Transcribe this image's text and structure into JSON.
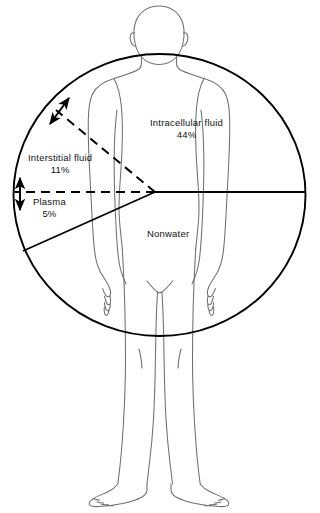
{
  "diagram": {
    "shape": "circle overlay divided into sectors",
    "colors": {
      "background": "#ffffff",
      "sector_line": "#000000",
      "figure_outline": "#6f6f6f",
      "text": "#111111"
    }
  },
  "labels": [
    {
      "id": "intracellular",
      "name": "Intracellular fluid",
      "percent": "44%",
      "sector": "upper right / right half of circle"
    },
    {
      "id": "interstitial",
      "name": "Interstitial fluid",
      "percent": "11%",
      "sector": "upper left wedge between dashed lines"
    },
    {
      "id": "plasma",
      "name": "Plasma",
      "percent": "5%",
      "sector": "narrow left wedge below dashed horizontal"
    },
    {
      "id": "nonwater",
      "name": "Nonwater",
      "percent": "",
      "sector": "lower portion of circle"
    }
  ],
  "geometry": {
    "circle": {
      "cx": 159.5,
      "cy": 195,
      "rx": 146,
      "ry": 141
    },
    "vertex": {
      "x": 155,
      "y": 192
    },
    "rays": [
      {
        "id": "dashed-upper-left",
        "to_x": 56,
        "to_y": 110,
        "style": "dashed"
      },
      {
        "id": "dashed-horizontal-left",
        "to_x": 15,
        "to_y": 192,
        "style": "dashed"
      },
      {
        "id": "solid-lower-left",
        "to_x": 23,
        "to_y": 251,
        "style": "solid"
      },
      {
        "id": "solid-horizontal-right",
        "to_x": 305,
        "to_y": 192,
        "style": "solid"
      }
    ],
    "arrows": [
      {
        "id": "interstitial-span-arrow",
        "x1": 50,
        "y1": 123,
        "x2": 68,
        "y2": 99
      },
      {
        "id": "plasma-span-arrow",
        "x1": 20,
        "y1": 178,
        "x2": 20,
        "y2": 209
      }
    ]
  }
}
